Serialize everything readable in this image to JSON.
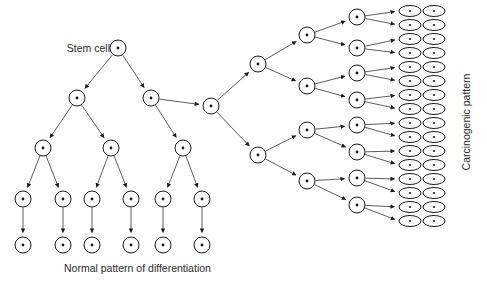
{
  "figure": {
    "title": "",
    "background_color": "#ffffff",
    "stroke_color": "#1a1a1a",
    "edge_color": "#4a4a4a",
    "text_color": "#2b2b2b",
    "width": 487,
    "height": 282
  },
  "labels": {
    "stem_cell": "Stem cell",
    "normal_pattern": "Normal pattern of differentiation",
    "carcinogenic_pattern": "Carcinogenic pattern"
  },
  "chart_data": {
    "type": "diagram",
    "title": "",
    "node_shapes": {
      "circle": "undifferentiated / dividing cell",
      "ellipse": "terminal carcinogenic cell"
    },
    "nodes": [
      {
        "id": "root",
        "x": 118,
        "y": 48,
        "shape": "circle",
        "label": "Stem cell"
      },
      {
        "id": "L1",
        "x": 77,
        "y": 98,
        "shape": "circle"
      },
      {
        "id": "L2",
        "x": 151,
        "y": 98,
        "shape": "circle"
      },
      {
        "id": "L1a",
        "x": 43,
        "y": 148,
        "shape": "circle"
      },
      {
        "id": "L1b",
        "x": 111,
        "y": 148,
        "shape": "circle"
      },
      {
        "id": "L2a",
        "x": 183,
        "y": 148,
        "shape": "circle"
      },
      {
        "id": "N1",
        "x": 23,
        "y": 199,
        "shape": "circle"
      },
      {
        "id": "N2",
        "x": 63,
        "y": 199,
        "shape": "circle"
      },
      {
        "id": "N3",
        "x": 92,
        "y": 199,
        "shape": "circle"
      },
      {
        "id": "N4",
        "x": 131,
        "y": 199,
        "shape": "circle"
      },
      {
        "id": "N5",
        "x": 163,
        "y": 199,
        "shape": "circle"
      },
      {
        "id": "N6",
        "x": 202,
        "y": 199,
        "shape": "circle"
      },
      {
        "id": "T1",
        "x": 23,
        "y": 245,
        "shape": "circle"
      },
      {
        "id": "T2",
        "x": 63,
        "y": 245,
        "shape": "circle"
      },
      {
        "id": "T3",
        "x": 92,
        "y": 245,
        "shape": "circle"
      },
      {
        "id": "T4",
        "x": 131,
        "y": 245,
        "shape": "circle"
      },
      {
        "id": "T5",
        "x": 163,
        "y": 245,
        "shape": "circle"
      },
      {
        "id": "T6",
        "x": 202,
        "y": 245,
        "shape": "circle"
      },
      {
        "id": "C0",
        "x": 211,
        "y": 106,
        "shape": "circle"
      },
      {
        "id": "C1",
        "x": 258,
        "y": 64,
        "shape": "circle"
      },
      {
        "id": "C2",
        "x": 258,
        "y": 155,
        "shape": "circle"
      },
      {
        "id": "D1",
        "x": 307,
        "y": 35,
        "shape": "circle"
      },
      {
        "id": "D2",
        "x": 307,
        "y": 86,
        "shape": "circle"
      },
      {
        "id": "D3",
        "x": 307,
        "y": 130,
        "shape": "circle"
      },
      {
        "id": "D4",
        "x": 307,
        "y": 181,
        "shape": "circle"
      },
      {
        "id": "E1",
        "x": 357,
        "y": 17,
        "shape": "circle"
      },
      {
        "id": "E2",
        "x": 357,
        "y": 48,
        "shape": "circle"
      },
      {
        "id": "E3",
        "x": 357,
        "y": 73,
        "shape": "circle"
      },
      {
        "id": "E4",
        "x": 357,
        "y": 100,
        "shape": "circle"
      },
      {
        "id": "E5",
        "x": 357,
        "y": 125,
        "shape": "circle"
      },
      {
        "id": "E6",
        "x": 357,
        "y": 152,
        "shape": "circle"
      },
      {
        "id": "E7",
        "x": 357,
        "y": 178,
        "shape": "circle"
      },
      {
        "id": "E8",
        "x": 357,
        "y": 205,
        "shape": "circle"
      }
    ],
    "terminal_ellipse_grid": {
      "columns_x": [
        410,
        434
      ],
      "rows_y": [
        11,
        25,
        39,
        53,
        67,
        81,
        95,
        109,
        123,
        137,
        151,
        165,
        179,
        193,
        207,
        221
      ],
      "rx": 11,
      "ry": 5.5,
      "count": 32
    },
    "edges": [
      {
        "from": "root",
        "to": "L1"
      },
      {
        "from": "root",
        "to": "L2"
      },
      {
        "from": "L1",
        "to": "L1a"
      },
      {
        "from": "L1",
        "to": "L1b"
      },
      {
        "from": "L2",
        "to": "C0"
      },
      {
        "from": "L2",
        "to": "L2a"
      },
      {
        "from": "L1a",
        "to": "N1"
      },
      {
        "from": "L1a",
        "to": "N2"
      },
      {
        "from": "L1b",
        "to": "N3"
      },
      {
        "from": "L1b",
        "to": "N4"
      },
      {
        "from": "L2a",
        "to": "N5"
      },
      {
        "from": "L2a",
        "to": "N6"
      },
      {
        "from": "N1",
        "to": "T1"
      },
      {
        "from": "N2",
        "to": "T2"
      },
      {
        "from": "N3",
        "to": "T3"
      },
      {
        "from": "N4",
        "to": "T4"
      },
      {
        "from": "N5",
        "to": "T5"
      },
      {
        "from": "N6",
        "to": "T6"
      },
      {
        "from": "C0",
        "to": "C1"
      },
      {
        "from": "C0",
        "to": "C2"
      },
      {
        "from": "C1",
        "to": "D1"
      },
      {
        "from": "C1",
        "to": "D2"
      },
      {
        "from": "C2",
        "to": "D3"
      },
      {
        "from": "C2",
        "to": "D4"
      },
      {
        "from": "D1",
        "to": "E1"
      },
      {
        "from": "D1",
        "to": "E2"
      },
      {
        "from": "D2",
        "to": "E3"
      },
      {
        "from": "D2",
        "to": "E4"
      },
      {
        "from": "D3",
        "to": "E5"
      },
      {
        "from": "D3",
        "to": "E6"
      },
      {
        "from": "D4",
        "to": "E7"
      },
      {
        "from": "D4",
        "to": "E8"
      }
    ],
    "leaf_edges_note": "each of the 8 'E' circles emits two arrows into the first ellipse column; the first ellipse column feeds the second"
  }
}
